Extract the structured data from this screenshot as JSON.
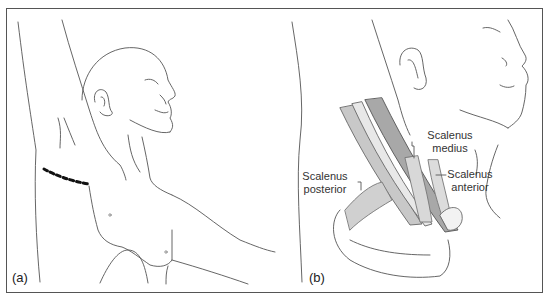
{
  "figure": {
    "panels": [
      {
        "id": "a",
        "label": "(a)"
      },
      {
        "id": "b",
        "label": "(b)"
      }
    ],
    "annotations": {
      "scalenus_medius": "Scalenus\nmedius",
      "scalenus_medius_l1": "Scalenus",
      "scalenus_medius_l2": "medius",
      "scalenus_posterior_l1": "Scalenus",
      "scalenus_posterior_l2": "posterior",
      "scalenus_anterior_l1": "Scalenus",
      "scalenus_anterior_l2": "anterior"
    },
    "colors": {
      "line": "#555555",
      "muscle_fill": "#b8b8b8",
      "muscle_dark": "#9a9a9a",
      "incision": "#111111",
      "frame": "#555555"
    }
  }
}
